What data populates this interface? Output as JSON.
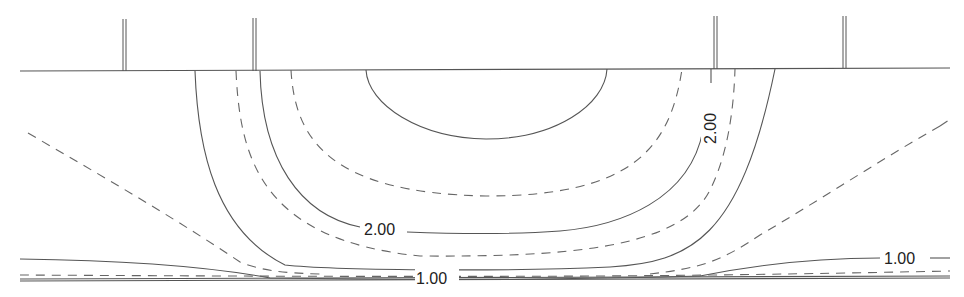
{
  "diagram": {
    "type": "contour-plot",
    "colors": {
      "line": "#555555",
      "dashed_line": "#666666",
      "label": "#222222",
      "background": "#ffffff"
    },
    "contour_labels": [
      {
        "text": "2.00",
        "position": "inner-right-vertical"
      },
      {
        "text": "2.00",
        "position": "inner-bottom"
      },
      {
        "text": "1.00",
        "position": "right"
      },
      {
        "text": "1.00",
        "position": "bottom-center"
      }
    ],
    "posts": 4,
    "line_styles": [
      "solid",
      "dashed"
    ]
  }
}
